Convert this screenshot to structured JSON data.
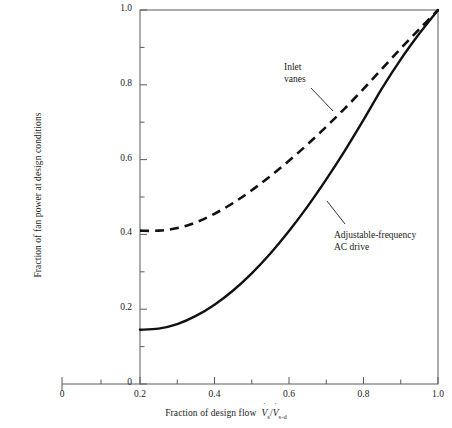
{
  "chart_data": {
    "type": "line",
    "title": "",
    "xlabel": "Fraction of design flow",
    "xlabel_symbol_num": "V",
    "xlabel_symbol_num_sub": "s",
    "xlabel_symbol_den": "V",
    "xlabel_symbol_den_sub": "s-d",
    "ylabel": "Fraction of fan power at design conditions",
    "xlim": [
      0,
      1.0
    ],
    "ylim": [
      0,
      1.0
    ],
    "x_plot_range": [
      0.2,
      1.0
    ],
    "grid": false,
    "legend": "annotations-on-plot",
    "xticks": [
      "0",
      "0.2",
      "0.4",
      "0.6",
      "0.8",
      "1.0"
    ],
    "xtick_values": [
      0,
      0.2,
      0.4,
      0.6,
      0.8,
      1.0
    ],
    "yticks": [
      "0",
      "0.2",
      "0.4",
      "0.6",
      "0.8",
      "1.0"
    ],
    "ytick_values": [
      0,
      0.2,
      0.4,
      0.6,
      0.8,
      1.0
    ],
    "minor_ticks": true,
    "series": [
      {
        "name": "Inlet vanes",
        "style": "dashed",
        "color": "#111111",
        "annotation": "Inlet\nvanes",
        "annotation_line1": "Inlet",
        "annotation_line2": "vanes",
        "x": [
          0.2,
          0.25,
          0.3,
          0.35,
          0.4,
          0.45,
          0.5,
          0.55,
          0.6,
          0.65,
          0.7,
          0.75,
          0.8,
          0.85,
          0.9,
          0.95,
          1.0
        ],
        "values": [
          0.41,
          0.41,
          0.417,
          0.432,
          0.455,
          0.484,
          0.518,
          0.556,
          0.597,
          0.641,
          0.688,
          0.737,
          0.789,
          0.843,
          0.897,
          0.949,
          1.0
        ]
      },
      {
        "name": "Adjustable-frequency AC drive",
        "style": "solid",
        "color": "#111111",
        "annotation": "Adjustable-frequency\nAC drive",
        "annotation_line1": "Adjustable-frequency",
        "annotation_line2": "AC drive",
        "x": [
          0.2,
          0.25,
          0.3,
          0.35,
          0.4,
          0.45,
          0.5,
          0.55,
          0.6,
          0.65,
          0.7,
          0.75,
          0.8,
          0.85,
          0.9,
          0.95,
          1.0
        ],
        "values": [
          0.145,
          0.148,
          0.16,
          0.182,
          0.212,
          0.25,
          0.296,
          0.349,
          0.409,
          0.475,
          0.547,
          0.624,
          0.706,
          0.791,
          0.868,
          0.937,
          1.0
        ]
      }
    ]
  },
  "axes": {
    "frame_color": "#444444",
    "tick_color": "#444444"
  }
}
